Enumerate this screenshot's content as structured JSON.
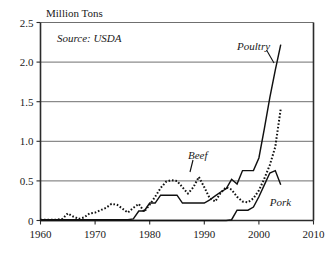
{
  "chart_data": {
    "type": "line",
    "title": "Million Tons",
    "xlabel": "",
    "ylabel": "Million Tons",
    "note": "Source: USDA",
    "xlim": [
      1960,
      2010
    ],
    "ylim": [
      0,
      2.5
    ],
    "grid": "horizontal",
    "legend_position": "inline-annotations",
    "x_ticks": [
      "1960",
      "1970",
      "1980",
      "1990",
      "2000",
      "2010"
    ],
    "x_tick_values": [
      1960,
      1970,
      1980,
      1990,
      2000,
      2010
    ],
    "y_ticks": [
      "0",
      "0.5",
      "1.0",
      "1.5",
      "2.0",
      "2.5"
    ],
    "y_tick_values": [
      0,
      0.5,
      1.0,
      1.5,
      2.0,
      2.5
    ],
    "series": [
      {
        "name": "Poultry",
        "style": "solid",
        "label": "Poultry",
        "x": [
          1960,
          1961,
          1962,
          1963,
          1964,
          1965,
          1966,
          1967,
          1968,
          1969,
          1970,
          1971,
          1972,
          1973,
          1974,
          1975,
          1976,
          1977,
          1978,
          1979,
          1980,
          1981,
          1982,
          1983,
          1984,
          1985,
          1986,
          1987,
          1988,
          1989,
          1990,
          1991,
          1992,
          1993,
          1994,
          1995,
          1996,
          1997,
          1998,
          1999,
          2000,
          2001,
          2002,
          2003,
          2004
        ],
        "y": [
          0.01,
          0.01,
          0.01,
          0.01,
          0.01,
          0.01,
          0.01,
          0.01,
          0.01,
          0.01,
          0.01,
          0.01,
          0.01,
          0.01,
          0.01,
          0.01,
          0.01,
          0.02,
          0.12,
          0.12,
          0.22,
          0.22,
          0.32,
          0.32,
          0.32,
          0.32,
          0.22,
          0.22,
          0.22,
          0.22,
          0.22,
          0.26,
          0.31,
          0.36,
          0.4,
          0.52,
          0.46,
          0.63,
          0.63,
          0.63,
          0.79,
          1.16,
          1.55,
          1.9,
          2.22
        ]
      },
      {
        "name": "Beef",
        "style": "dotted",
        "label": "Beef",
        "x": [
          1960,
          1961,
          1962,
          1963,
          1964,
          1965,
          1966,
          1967,
          1968,
          1969,
          1970,
          1971,
          1972,
          1973,
          1974,
          1975,
          1976,
          1977,
          1978,
          1979,
          1980,
          1981,
          1982,
          1983,
          1984,
          1985,
          1986,
          1987,
          1988,
          1989,
          1990,
          1991,
          1992,
          1993,
          1994,
          1995,
          1996,
          1997,
          1998,
          1999,
          2000,
          2001,
          2002,
          2003,
          2004
        ],
        "y": [
          0.01,
          0.01,
          0.01,
          0.01,
          0.02,
          0.09,
          0.05,
          0.02,
          0.04,
          0.09,
          0.1,
          0.13,
          0.16,
          0.21,
          0.2,
          0.15,
          0.1,
          0.16,
          0.21,
          0.11,
          0.2,
          0.3,
          0.41,
          0.49,
          0.51,
          0.5,
          0.42,
          0.34,
          0.42,
          0.55,
          0.42,
          0.28,
          0.24,
          0.35,
          0.42,
          0.39,
          0.3,
          0.24,
          0.23,
          0.28,
          0.38,
          0.53,
          0.7,
          0.93,
          1.41
        ]
      },
      {
        "name": "Pork",
        "style": "solid",
        "label": "Pork",
        "x": [
          1960,
          1980,
          1990,
          1994,
          1995,
          1996,
          1997,
          1998,
          1999,
          2000,
          2001,
          2002,
          2003,
          2004
        ],
        "y": [
          0.0,
          0.0,
          0.0,
          0.0,
          0.01,
          0.13,
          0.13,
          0.13,
          0.17,
          0.3,
          0.45,
          0.6,
          0.63,
          0.45
        ]
      }
    ],
    "annotations": [
      {
        "text": "Source: USDA",
        "x": 1963,
        "y": 2.26
      },
      {
        "text": "Poultry",
        "x": 1996,
        "y": 2.15
      },
      {
        "text": "Beef",
        "x": 1987,
        "y": 0.78
      },
      {
        "text": "Pork",
        "x": 2002,
        "y": 0.18
      }
    ],
    "colors": {
      "line": "#111111",
      "grid": "#6f6f6f",
      "axis": "#2b2b2b",
      "background": "#ffffff"
    }
  }
}
